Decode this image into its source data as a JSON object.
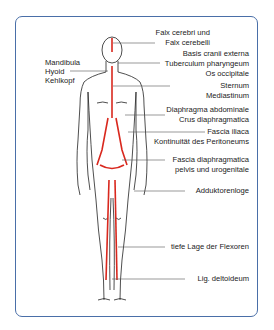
{
  "diagram": {
    "accent_color": "#d9281e",
    "frame_color": "#4a6fa8",
    "labels_left": [
      {
        "text": "Mandibula"
      },
      {
        "text": "Hyoid"
      },
      {
        "text": "Kehlkopf"
      }
    ],
    "labels_right": [
      {
        "text": "Falx cerebri und"
      },
      {
        "text": "Falx cerebelli"
      },
      {
        "text": "Basis cranii externa"
      },
      {
        "text": "Tuberculum pharyngeum"
      },
      {
        "text": "Os occipitale"
      },
      {
        "text": "Sternum"
      },
      {
        "text": "Mediastinum"
      },
      {
        "text": "Diaphragma abdominale"
      },
      {
        "text": "Crus diaphragmatica"
      },
      {
        "text": "Fascia iliaca"
      },
      {
        "text": "Kontinuität des Peritoneums"
      },
      {
        "text": "Fascia diaphragmatica"
      },
      {
        "text": "pelvis und urogenitale"
      },
      {
        "text": "Adduktorenloge"
      },
      {
        "text": "tiefe Lage der Flexoren"
      },
      {
        "text": "Lig. deltoideum"
      }
    ]
  }
}
